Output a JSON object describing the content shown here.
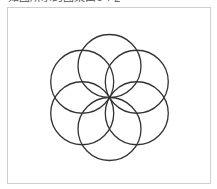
{
  "caption": {
    "text": "如图所示的图案由6个圆组成"
  },
  "diagram": {
    "shape": "circle",
    "count": 6,
    "arrangement": "rotated around common center point, each circle passing through the center",
    "angles_deg": [
      90,
      30,
      -30,
      -90,
      -150,
      150
    ],
    "stroke_color": "#333333",
    "frame_border_color": "#cfcfcf"
  }
}
